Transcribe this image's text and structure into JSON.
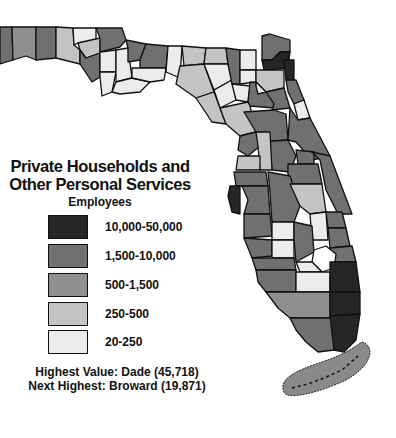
{
  "title_line1": "Private Households and",
  "title_line2": "Other Personal Services",
  "subtitle": "Employees",
  "legend": [
    {
      "label": "10,000-50,000",
      "color": "#262626"
    },
    {
      "label": "1,500-10,000",
      "color": "#707070"
    },
    {
      "label": "500-1,500",
      "color": "#8f8f8f"
    },
    {
      "label": "250-500",
      "color": "#c4c4c4"
    },
    {
      "label": "20-250",
      "color": "#ececec"
    }
  ],
  "notes": {
    "highest": "Highest Value: Dade (45,718)",
    "next_highest": "Next Highest: Broward (19,871)"
  }
}
